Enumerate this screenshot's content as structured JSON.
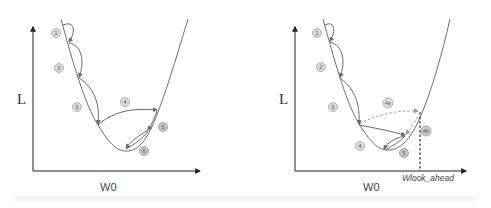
{
  "panels": [
    {
      "id": "standard-momentum",
      "y_axis_label": "L",
      "x_axis_label": "W0",
      "steps": [
        "1",
        "2",
        "3",
        "4",
        "5",
        "6"
      ]
    },
    {
      "id": "nesterov-momentum",
      "y_axis_label": "L",
      "x_axis_label": "W0",
      "lookahead_label": "Wlook_ahead",
      "steps": [
        "1",
        "2",
        "3",
        "4a",
        "4b",
        "4",
        "5"
      ]
    }
  ],
  "colors": {
    "curve": "#6e6e6e",
    "arrow": "#6a6a6a",
    "dashed": "#9a9a9a",
    "badge_fill": "#dcdcdc",
    "badge_stroke": "#999999",
    "axis": "#222222"
  }
}
